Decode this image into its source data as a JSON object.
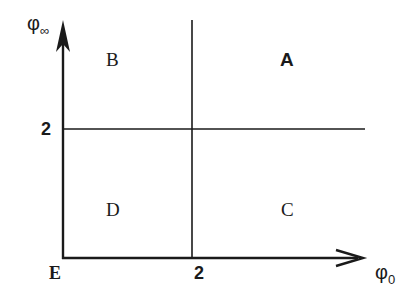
{
  "diagram": {
    "type": "quadrant-phase-diagram",
    "axes": {
      "x": {
        "symbol": "φ",
        "subscript": "0",
        "tick_label": "2"
      },
      "y": {
        "symbol": "φ",
        "subscript": "∞",
        "tick_label": "2"
      },
      "origin_label": "E"
    },
    "regions": {
      "top_left": "B",
      "top_right": "A",
      "bottom_left": "D",
      "bottom_right": "C"
    },
    "colors": {
      "ink": "#1a1a1a",
      "background": "#ffffff"
    }
  }
}
